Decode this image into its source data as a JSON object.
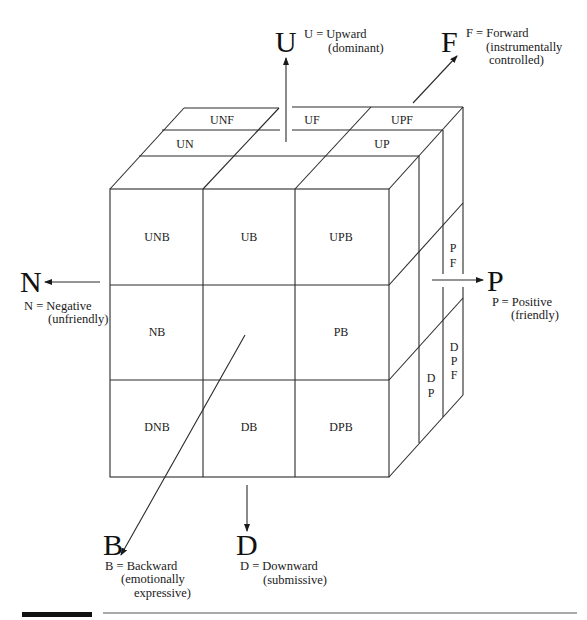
{
  "diagram": {
    "type": "3D cube of interpersonal dimensions",
    "axes": {
      "U": {
        "letter": "U",
        "def_line1": "U = Upward",
        "def_line2": "(dominant)",
        "def_line3": ""
      },
      "F": {
        "letter": "F",
        "def_line1": "F = Forward",
        "def_line2": "(instrumentally",
        "def_line3": "controlled)"
      },
      "N": {
        "letter": "N",
        "def_line1": "N = Negative",
        "def_line2": "(unfriendly)",
        "def_line3": ""
      },
      "P": {
        "letter": "P",
        "def_line1": "P = Positive",
        "def_line2": "(friendly)",
        "def_line3": ""
      },
      "B": {
        "letter": "B",
        "def_line1": "B = Backward",
        "def_line2": "(emotionally",
        "def_line3": "expressive)"
      },
      "D": {
        "letter": "D",
        "def_line1": "D = Downward",
        "def_line2": "(submissive)",
        "def_line3": ""
      }
    },
    "front_face": {
      "rows": [
        [
          "UNB",
          "UB",
          "UPB"
        ],
        [
          "NB",
          "",
          "PB"
        ],
        [
          "DNB",
          "DB",
          "DPB"
        ]
      ]
    },
    "top_face": {
      "UNF": "UNF",
      "UF": "UF",
      "UPF": "UPF",
      "UN": "UN",
      "UP": "UP"
    },
    "right_face": {
      "PF": [
        "P",
        "F"
      ],
      "DP": [
        "D",
        "P"
      ],
      "DPF": [
        "D",
        "P",
        "F"
      ]
    }
  }
}
